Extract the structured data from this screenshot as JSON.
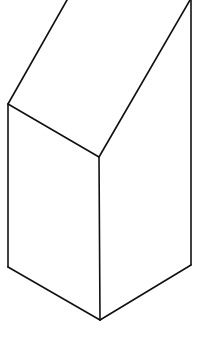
{
  "diagram": {
    "type": "isometric-prism-line-drawing",
    "stroke_color": "#111111",
    "background": "#ffffff",
    "edges": [
      {
        "name": "left-slope-edge",
        "points": [
          [
            67,
            0
          ],
          [
            8,
            104
          ]
        ]
      },
      {
        "name": "front-slope-edge",
        "points": [
          [
            190,
            0
          ],
          [
            99,
            157
          ]
        ]
      },
      {
        "name": "top-front-edge",
        "points": [
          [
            8,
            104
          ],
          [
            99,
            157
          ]
        ]
      },
      {
        "name": "left-vertical-edge",
        "points": [
          [
            8,
            104
          ],
          [
            8,
            267
          ]
        ]
      },
      {
        "name": "front-vertical-edge",
        "points": [
          [
            99,
            157
          ],
          [
            100,
            320
          ]
        ]
      },
      {
        "name": "right-vertical-edge",
        "points": [
          [
            191,
            0
          ],
          [
            191,
            265
          ]
        ]
      },
      {
        "name": "bottom-left-edge",
        "points": [
          [
            8,
            267
          ],
          [
            100,
            320
          ]
        ]
      },
      {
        "name": "bottom-right-edge",
        "points": [
          [
            100,
            320
          ],
          [
            191,
            265
          ]
        ]
      }
    ]
  }
}
